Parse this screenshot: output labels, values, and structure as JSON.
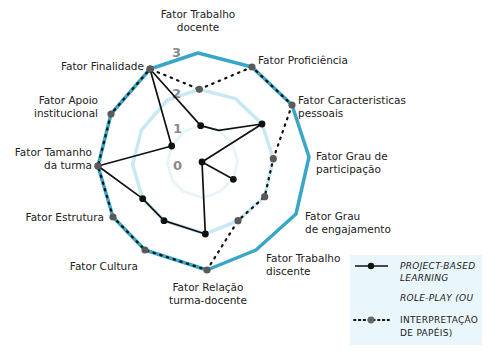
{
  "chart_data": {
    "type": "radar",
    "title": "",
    "scale": {
      "min": 0,
      "max": 3,
      "ticks": [
        "0",
        "1",
        "2",
        "3"
      ]
    },
    "axes": [
      "Fator Trabalho docente",
      "Fator Proficiência",
      "Fator Caracteristicas pessoais",
      "Fator Grau de participação",
      "Fator Grau de engajamento",
      "Fator Trabalho discente",
      "Fator Relação turma-docente",
      "Fator Cultura",
      "Fator Estrutura",
      "Fator Tamanho da turma",
      "Fator Apoio institucional",
      "Fator Finalidade"
    ],
    "axis_label_lines": [
      [
        "Fator Trabalho",
        "docente"
      ],
      [
        "Fator Proficiência"
      ],
      [
        "Fator Caracteristicas",
        "pessoais"
      ],
      [
        "Fator Grau de",
        "participação"
      ],
      [
        "Fator Grau",
        "de engajamento"
      ],
      [
        "Fator Trabalho",
        "discente"
      ],
      [
        "Fator Relação",
        "turma-docente"
      ],
      [
        "Fator Cultura"
      ],
      [
        "Fator Estrutura"
      ],
      [
        "Fator Tamanho",
        "da turma"
      ],
      [
        "Fator Apoio",
        "institucional"
      ],
      [
        "Fator Finalidade"
      ]
    ],
    "series": [
      {
        "name": "PROJECT-BASED LEARNING",
        "style": "solid",
        "color": "#111111",
        "values": [
          1,
          1,
          2,
          0,
          1,
          0,
          2,
          2,
          2,
          3,
          1,
          3
        ],
        "marked": [
          true,
          false,
          true,
          true,
          true,
          false,
          true,
          true,
          true,
          true,
          true,
          true
        ]
      },
      {
        "name": "ROLE-PLAY (OU INTERPRETAÇÃO DE PAPÉIS)",
        "style": "dotted",
        "color": "#555555",
        "values": [
          2,
          3,
          3,
          2,
          2,
          2,
          3,
          3,
          3,
          3,
          3,
          3
        ],
        "marked": [
          true,
          true,
          true,
          true,
          true,
          true,
          true,
          true,
          true,
          true,
          true,
          true
        ]
      }
    ],
    "grid_colors": {
      "outer": "#3aa6c6",
      "ring2": "#c8e9f3",
      "ring1": "#e4f4f9"
    },
    "legend": {
      "position": "bottom-right",
      "background": "#e9f6fb",
      "items": [
        {
          "lines": [
            "PROJECT-BASED",
            "LEARNING"
          ],
          "style": "solid"
        },
        {
          "lines": [
            "ROLE-PLAY (OU",
            "INTERPRETAÇÃO",
            "DE PAPÉIS)"
          ],
          "style": "dotted"
        }
      ]
    }
  }
}
